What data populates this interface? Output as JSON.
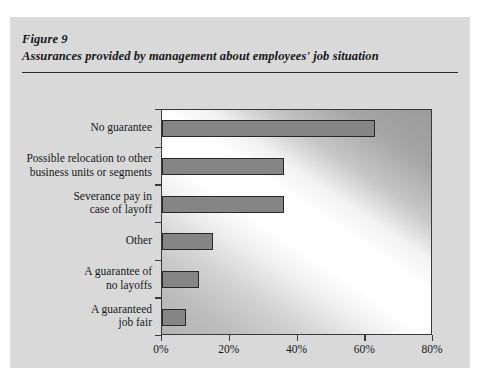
{
  "figure": {
    "label": "Figure 9",
    "title": "Assurances provided by management about employees' job situation"
  },
  "colors": {
    "panel_background": "#d9d9d9",
    "bar_fill": "#858585",
    "bar_border": "#27272a",
    "axis": "#3a3a3d",
    "text": "#17171a"
  },
  "chart_data": {
    "type": "bar",
    "orientation": "horizontal",
    "title": "Assurances provided by management about employees' job situation",
    "xlabel": "",
    "ylabel": "",
    "xlim": [
      0,
      80
    ],
    "xticks": [
      0,
      20,
      40,
      60,
      80
    ],
    "xticklabels": [
      "0%",
      "20%",
      "40%",
      "60%",
      "80%"
    ],
    "grid": false,
    "legend": false,
    "categories": [
      "No guarantee",
      "Possible relocation to other business units or segments",
      "Severance pay in case of layoff",
      "Other",
      "A guarantee of no layoffs",
      "A guaranteed job fair"
    ],
    "category_label_lines": [
      [
        "No guarantee"
      ],
      [
        "Possible relocation to other",
        "business units or segments"
      ],
      [
        "Severance pay in",
        "case of layoff"
      ],
      [
        "Other"
      ],
      [
        "A guarantee of",
        "no layoffs"
      ],
      [
        "A guaranteed",
        "job fair"
      ]
    ],
    "values": [
      63,
      36,
      36,
      15,
      11,
      7
    ],
    "value_unit": "%"
  }
}
